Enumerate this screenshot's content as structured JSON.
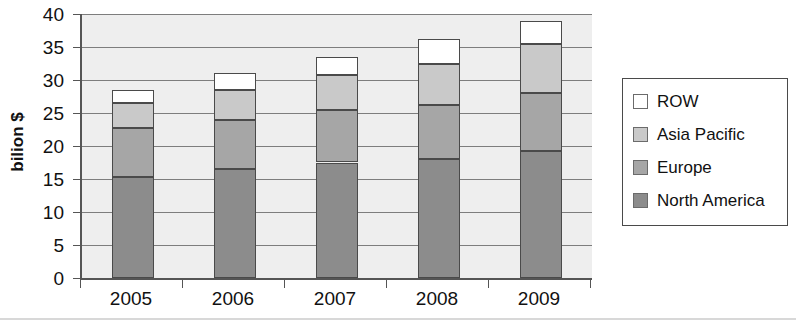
{
  "chart_data": {
    "type": "bar",
    "subtype": "stacked-vertical",
    "title": "",
    "xlabel": "",
    "ylabel": "bilion $",
    "categories": [
      "2005",
      "2006",
      "2007",
      "2008",
      "2009"
    ],
    "ylim": [
      0,
      40
    ],
    "yticks": [
      0,
      5,
      10,
      15,
      20,
      25,
      30,
      35,
      40
    ],
    "ytick_labels": [
      "0",
      "5",
      "10",
      "15",
      "20",
      "25",
      "30",
      "35",
      "40"
    ],
    "grid": true,
    "grid_axis": "y",
    "legend_position": "right",
    "series": [
      {
        "name": "North America",
        "color": "#8c8c8c",
        "values": [
          15.3,
          16.5,
          17.5,
          18.1,
          19.2
        ]
      },
      {
        "name": "Europe",
        "color": "#a6a6a6",
        "values": [
          7.4,
          7.5,
          8.0,
          8.1,
          8.8
        ]
      },
      {
        "name": "Asia Pacific",
        "color": "#c9c9c9",
        "values": [
          3.8,
          4.5,
          5.2,
          6.2,
          7.4
        ]
      },
      {
        "name": "ROW",
        "color": "#ffffff",
        "values": [
          2.0,
          2.5,
          2.8,
          3.8,
          3.6
        ]
      }
    ],
    "cumulative_tops": {
      "North America": [
        15.3,
        16.5,
        17.5,
        18.1,
        19.2
      ],
      "Europe": [
        22.7,
        24.0,
        25.5,
        26.2,
        28.0
      ],
      "Asia Pacific": [
        26.5,
        28.5,
        30.7,
        32.4,
        35.4
      ],
      "ROW": [
        28.5,
        31.0,
        33.5,
        36.2,
        39.0
      ]
    },
    "totals": [
      28.5,
      31.0,
      33.5,
      36.2,
      39.0
    ],
    "plot_background": "#eeeeee",
    "gridline_color": "#7d7d7d",
    "axis_color": "#555555",
    "bar_edge_color": "#4a4a4a"
  },
  "legend": {
    "entries": [
      {
        "label": "ROW",
        "color": "#ffffff"
      },
      {
        "label": "Asia Pacific",
        "color": "#c9c9c9"
      },
      {
        "label": "Europe",
        "color": "#a6a6a6"
      },
      {
        "label": "North America",
        "color": "#8c8c8c"
      }
    ]
  }
}
